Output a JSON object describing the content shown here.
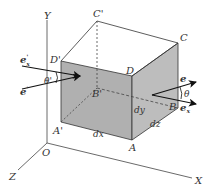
{
  "diagram": {
    "type": "isometric-cube-with-axes",
    "axes": {
      "origin": "O",
      "x": "X",
      "y": "Y",
      "z": "Z"
    },
    "vertices": {
      "A": "A",
      "A_prime": "A'",
      "B": "B",
      "B_prime": "B'",
      "C": "C",
      "C_prime": "C'",
      "D": "D",
      "D_prime": "D'"
    },
    "dimensions": {
      "dx": "dx",
      "dy": "dy",
      "dz": "dz"
    },
    "vectors_left": {
      "e_x_prime_main": "e",
      "e_x_prime_sub": "x",
      "e_x_prime_sup": "'",
      "e_prime_main": "e",
      "e_prime_sup": "'",
      "angle": "θ'"
    },
    "vectors_right": {
      "e_main": "e",
      "e_x_main": "e",
      "e_x_sub": "x",
      "angle": "θ"
    },
    "colors": {
      "face_fill": "#b0b0b0",
      "side_fill": "#bdbdbd",
      "line": "#333333",
      "arrow": "#111111"
    }
  }
}
